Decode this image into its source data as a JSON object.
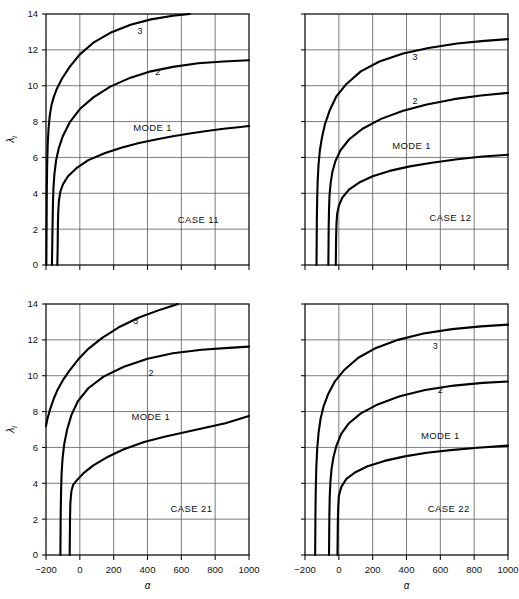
{
  "figure": {
    "background": "#ffffff",
    "ink": "#000000",
    "grid_color": "#5a5a5a",
    "panel_count": 4
  },
  "axes": {
    "x": {
      "label": "α",
      "min": -200,
      "max": 1000,
      "ticks": [
        -200,
        0,
        200,
        400,
        600,
        800,
        1000
      ],
      "tick_labels": [
        "−200",
        "0",
        "200",
        "400",
        "600",
        "800",
        "1000"
      ],
      "grid": true
    },
    "y": {
      "label": "λ",
      "label_subscript": "i",
      "min": 0,
      "max": 14,
      "ticks": [
        0,
        2,
        4,
        6,
        8,
        10,
        12,
        14
      ],
      "tick_labels": [
        "0",
        "2",
        "4",
        "6",
        "8",
        "10",
        "12",
        "14"
      ],
      "grid": true
    }
  },
  "labels": {
    "mode1": "MODE 1",
    "mode2": "2",
    "mode3": "3"
  },
  "chart_data": [
    {
      "type": "line",
      "id": "case-11",
      "title": "CASE 11",
      "xlabel": "α",
      "ylabel": "λᵢ",
      "xlim": [
        -200,
        1000
      ],
      "ylim": [
        0,
        14
      ],
      "xticks": [
        -200,
        0,
        200,
        400,
        600,
        800,
        1000
      ],
      "yticks": [
        0,
        2,
        4,
        6,
        8,
        10,
        12,
        14
      ],
      "grid": true,
      "legend": "inline-curve-labels",
      "annotations": [
        {
          "text": "CASE 11",
          "x": 700,
          "y": 2.35
        },
        {
          "text": "MODE 1",
          "x": 430,
          "y": 7.5
        },
        {
          "text": "2",
          "x": 460,
          "y": 10.6
        },
        {
          "text": "3",
          "x": 355,
          "y": 12.9
        }
      ],
      "series": [
        {
          "name": "MODE 1",
          "points": [
            [
              -133,
              0
            ],
            [
              -131,
              1.0
            ],
            [
              -130,
              2.0
            ],
            [
              -128,
              2.9
            ],
            [
              -124,
              3.55
            ],
            [
              -115,
              4.1
            ],
            [
              -100,
              4.5
            ],
            [
              -70,
              4.95
            ],
            [
              -20,
              5.4
            ],
            [
              50,
              5.85
            ],
            [
              150,
              6.25
            ],
            [
              250,
              6.55
            ],
            [
              350,
              6.8
            ],
            [
              450,
              7.0
            ],
            [
              550,
              7.18
            ],
            [
              650,
              7.33
            ],
            [
              750,
              7.47
            ],
            [
              850,
              7.6
            ],
            [
              950,
              7.7
            ],
            [
              1000,
              7.75
            ]
          ]
        },
        {
          "name": "2",
          "points": [
            [
              -165,
              0
            ],
            [
              -163,
              1.2
            ],
            [
              -161,
              2.4
            ],
            [
              -159,
              3.4
            ],
            [
              -156,
              4.3
            ],
            [
              -150,
              5.1
            ],
            [
              -140,
              5.85
            ],
            [
              -125,
              6.5
            ],
            [
              -100,
              7.2
            ],
            [
              -60,
              7.95
            ],
            [
              0,
              8.7
            ],
            [
              80,
              9.35
            ],
            [
              180,
              9.95
            ],
            [
              300,
              10.45
            ],
            [
              420,
              10.8
            ],
            [
              550,
              11.05
            ],
            [
              700,
              11.25
            ],
            [
              850,
              11.35
            ],
            [
              1000,
              11.42
            ]
          ]
        },
        {
          "name": "3",
          "points": [
            [
              -198,
              0
            ],
            [
              -197,
              1.5
            ],
            [
              -196,
              3.0
            ],
            [
              -195,
              4.4
            ],
            [
              -193,
              5.6
            ],
            [
              -190,
              6.7
            ],
            [
              -185,
              7.6
            ],
            [
              -178,
              8.3
            ],
            [
              -168,
              8.9
            ],
            [
              -155,
              9.35
            ],
            [
              -135,
              9.85
            ],
            [
              -105,
              10.4
            ],
            [
              -60,
              11.05
            ],
            [
              0,
              11.75
            ],
            [
              80,
              12.4
            ],
            [
              180,
              12.95
            ],
            [
              300,
              13.4
            ],
            [
              420,
              13.7
            ],
            [
              550,
              13.9
            ],
            [
              650,
              14.0
            ]
          ]
        }
      ]
    },
    {
      "type": "line",
      "id": "case-12",
      "title": "CASE 12",
      "xlabel": "α",
      "ylabel": "λᵢ",
      "xlim": [
        -200,
        1000
      ],
      "ylim": [
        0,
        14
      ],
      "xticks": [
        -200,
        0,
        200,
        400,
        600,
        800,
        1000
      ],
      "yticks": [
        0,
        2,
        4,
        6,
        8,
        10,
        12,
        14
      ],
      "grid": true,
      "legend": "inline-curve-labels",
      "annotations": [
        {
          "text": "CASE 12",
          "x": 660,
          "y": 2.45
        },
        {
          "text": "MODE 1",
          "x": 430,
          "y": 6.45
        },
        {
          "text": "2",
          "x": 450,
          "y": 9.0
        },
        {
          "text": "3",
          "x": 450,
          "y": 11.45
        }
      ],
      "series": [
        {
          "name": "MODE 1",
          "points": [
            [
              -18,
              0
            ],
            [
              -17,
              0.8
            ],
            [
              -16,
              1.6
            ],
            [
              -14,
              2.3
            ],
            [
              -10,
              2.85
            ],
            [
              0,
              3.3
            ],
            [
              20,
              3.75
            ],
            [
              60,
              4.2
            ],
            [
              120,
              4.6
            ],
            [
              200,
              4.95
            ],
            [
              300,
              5.25
            ],
            [
              420,
              5.5
            ],
            [
              550,
              5.7
            ],
            [
              700,
              5.9
            ],
            [
              850,
              6.05
            ],
            [
              1000,
              6.15
            ]
          ]
        },
        {
          "name": "2",
          "points": [
            [
              -62,
              0
            ],
            [
              -61,
              1.0
            ],
            [
              -60,
              2.1
            ],
            [
              -58,
              3.1
            ],
            [
              -55,
              3.9
            ],
            [
              -48,
              4.6
            ],
            [
              -38,
              5.2
            ],
            [
              -20,
              5.8
            ],
            [
              10,
              6.4
            ],
            [
              60,
              7.0
            ],
            [
              140,
              7.6
            ],
            [
              250,
              8.15
            ],
            [
              380,
              8.6
            ],
            [
              520,
              8.95
            ],
            [
              680,
              9.25
            ],
            [
              840,
              9.45
            ],
            [
              1000,
              9.6
            ]
          ]
        },
        {
          "name": "3",
          "points": [
            [
              -132,
              0
            ],
            [
              -131,
              1.2
            ],
            [
              -130,
              2.5
            ],
            [
              -128,
              3.7
            ],
            [
              -125,
              4.7
            ],
            [
              -120,
              5.6
            ],
            [
              -112,
              6.4
            ],
            [
              -100,
              7.1
            ],
            [
              -82,
              7.85
            ],
            [
              -55,
              8.6
            ],
            [
              -15,
              9.4
            ],
            [
              45,
              10.1
            ],
            [
              130,
              10.8
            ],
            [
              240,
              11.35
            ],
            [
              380,
              11.8
            ],
            [
              530,
              12.1
            ],
            [
              700,
              12.35
            ],
            [
              860,
              12.5
            ],
            [
              1000,
              12.6
            ]
          ]
        }
      ]
    },
    {
      "type": "line",
      "id": "case-21",
      "title": "CASE 21",
      "xlabel": "α",
      "ylabel": "λᵢ",
      "xlim": [
        -200,
        1000
      ],
      "ylim": [
        0,
        14
      ],
      "xticks": [
        -200,
        0,
        200,
        400,
        600,
        800,
        1000
      ],
      "yticks": [
        0,
        2,
        4,
        6,
        8,
        10,
        12,
        14
      ],
      "grid": true,
      "legend": "inline-curve-labels",
      "annotations": [
        {
          "text": "CASE 21",
          "x": 660,
          "y": 2.4
        },
        {
          "text": "MODE 1",
          "x": 420,
          "y": 7.55
        },
        {
          "text": "2",
          "x": 420,
          "y": 10.0
        },
        {
          "text": "3",
          "x": 330,
          "y": 12.9
        }
      ],
      "series": [
        {
          "name": "MODE 1",
          "points": [
            [
              -60,
              0
            ],
            [
              -59,
              1.0
            ],
            [
              -58,
              2.0
            ],
            [
              -56,
              2.9
            ],
            [
              -50,
              3.55
            ],
            [
              -40,
              3.9
            ],
            [
              -20,
              4.15
            ],
            [
              20,
              4.55
            ],
            [
              80,
              5.0
            ],
            [
              160,
              5.45
            ],
            [
              260,
              5.9
            ],
            [
              380,
              6.3
            ],
            [
              500,
              6.6
            ],
            [
              620,
              6.85
            ],
            [
              740,
              7.1
            ],
            [
              860,
              7.35
            ],
            [
              1000,
              7.75
            ]
          ]
        },
        {
          "name": "2",
          "points": [
            [
              -115,
              0
            ],
            [
              -114,
              1.2
            ],
            [
              -113,
              2.4
            ],
            [
              -111,
              3.5
            ],
            [
              -108,
              4.5
            ],
            [
              -102,
              5.4
            ],
            [
              -92,
              6.2
            ],
            [
              -75,
              7.0
            ],
            [
              -50,
              7.8
            ],
            [
              -10,
              8.6
            ],
            [
              50,
              9.3
            ],
            [
              140,
              9.95
            ],
            [
              260,
              10.5
            ],
            [
              400,
              10.95
            ],
            [
              550,
              11.25
            ],
            [
              720,
              11.45
            ],
            [
              880,
              11.55
            ],
            [
              1000,
              11.62
            ]
          ]
        },
        {
          "name": "3",
          "points": [
            [
              -200,
              7.2
            ],
            [
              -190,
              7.65
            ],
            [
              -175,
              8.15
            ],
            [
              -155,
              8.7
            ],
            [
              -130,
              9.25
            ],
            [
              -100,
              9.75
            ],
            [
              -60,
              10.3
            ],
            [
              -10,
              10.9
            ],
            [
              50,
              11.5
            ],
            [
              130,
              12.1
            ],
            [
              230,
              12.7
            ],
            [
              350,
              13.25
            ],
            [
              480,
              13.7
            ],
            [
              580,
              14.0
            ]
          ]
        }
      ]
    },
    {
      "type": "line",
      "id": "case-22",
      "title": "CASE 22",
      "xlabel": "α",
      "ylabel": "λᵢ",
      "xlim": [
        -200,
        1000
      ],
      "ylim": [
        0,
        14
      ],
      "xticks": [
        -200,
        0,
        200,
        400,
        600,
        800,
        1000
      ],
      "yticks": [
        0,
        2,
        4,
        6,
        8,
        10,
        12,
        14
      ],
      "grid": true,
      "legend": "inline-curve-labels",
      "annotations": [
        {
          "text": "CASE 22",
          "x": 650,
          "y": 2.4
        },
        {
          "text": "MODE 1",
          "x": 600,
          "y": 6.45
        },
        {
          "text": "2",
          "x": 600,
          "y": 9.05
        },
        {
          "text": "3",
          "x": 570,
          "y": 11.5
        }
      ],
      "series": [
        {
          "name": "MODE 1",
          "points": [
            [
              -8,
              0
            ],
            [
              -7,
              0.9
            ],
            [
              -6,
              1.8
            ],
            [
              -4,
              2.6
            ],
            [
              0,
              3.3
            ],
            [
              15,
              3.8
            ],
            [
              45,
              4.25
            ],
            [
              95,
              4.6
            ],
            [
              170,
              4.95
            ],
            [
              270,
              5.25
            ],
            [
              390,
              5.5
            ],
            [
              520,
              5.7
            ],
            [
              660,
              5.85
            ],
            [
              820,
              5.98
            ],
            [
              1000,
              6.1
            ]
          ]
        },
        {
          "name": "2",
          "points": [
            [
              -58,
              0
            ],
            [
              -57,
              1.1
            ],
            [
              -56,
              2.2
            ],
            [
              -54,
              3.2
            ],
            [
              -50,
              4.05
            ],
            [
              -43,
              4.8
            ],
            [
              -32,
              5.45
            ],
            [
              -14,
              6.1
            ],
            [
              14,
              6.75
            ],
            [
              60,
              7.35
            ],
            [
              130,
              7.9
            ],
            [
              230,
              8.4
            ],
            [
              360,
              8.85
            ],
            [
              510,
              9.2
            ],
            [
              680,
              9.45
            ],
            [
              850,
              9.6
            ],
            [
              1000,
              9.68
            ]
          ]
        },
        {
          "name": "3",
          "points": [
            [
              -140,
              0
            ],
            [
              -139,
              1.3
            ],
            [
              -138,
              2.6
            ],
            [
              -136,
              3.8
            ],
            [
              -133,
              4.9
            ],
            [
              -128,
              5.9
            ],
            [
              -120,
              6.8
            ],
            [
              -108,
              7.6
            ],
            [
              -90,
              8.3
            ],
            [
              -62,
              9.0
            ],
            [
              -22,
              9.7
            ],
            [
              35,
              10.35
            ],
            [
              115,
              11.0
            ],
            [
              220,
              11.55
            ],
            [
              350,
              12.0
            ],
            [
              500,
              12.35
            ],
            [
              670,
              12.6
            ],
            [
              840,
              12.75
            ],
            [
              1000,
              12.85
            ]
          ]
        }
      ]
    }
  ]
}
